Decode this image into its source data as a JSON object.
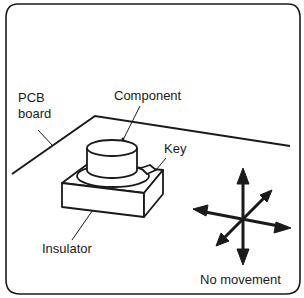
{
  "diagram": {
    "labels": {
      "pcb_line1": "PCB",
      "pcb_line2": "board",
      "component": "Component",
      "key": "Key",
      "insulator": "Insulator",
      "no_movement": "No movement"
    },
    "colors": {
      "stroke": "#1a1a1a",
      "background": "#ffffff"
    }
  }
}
